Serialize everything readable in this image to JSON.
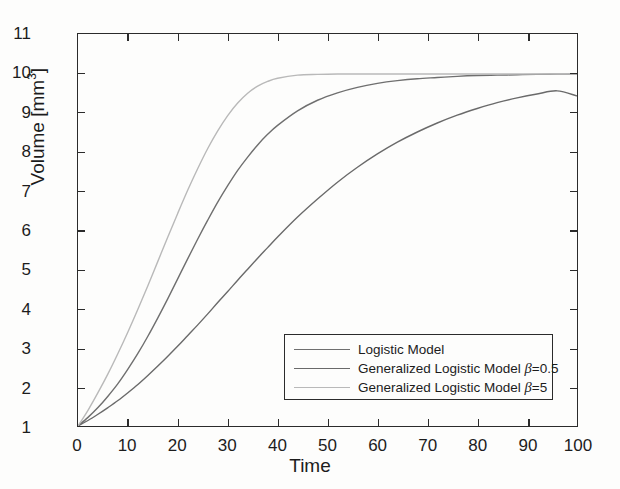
{
  "chart_data": {
    "type": "line",
    "title": "",
    "xlabel": "Time",
    "ylabel_text": "Volume [mm",
    "ylabel_sup": "3",
    "ylabel_tail": "]",
    "xlim": [
      0,
      100
    ],
    "ylim": [
      1,
      11
    ],
    "xticks": [
      0,
      10,
      20,
      30,
      40,
      50,
      60,
      70,
      80,
      90,
      100
    ],
    "yticks": [
      1,
      2,
      3,
      4,
      5,
      6,
      7,
      8,
      9,
      10,
      11
    ],
    "grid": false,
    "legend_position": "lower right",
    "x": [
      0,
      2,
      4,
      6,
      8,
      10,
      12,
      14,
      16,
      18,
      20,
      22,
      24,
      26,
      28,
      30,
      32,
      34,
      36,
      38,
      40,
      44,
      48,
      52,
      56,
      60,
      64,
      68,
      72,
      76,
      80,
      84,
      88,
      92,
      96,
      100
    ],
    "series": [
      {
        "name": "Logistic Model",
        "color": "#6f6f6f",
        "values": [
          1.0,
          1.22,
          1.47,
          1.76,
          2.08,
          2.45,
          2.85,
          3.29,
          3.76,
          4.25,
          4.76,
          5.27,
          5.77,
          6.25,
          6.71,
          7.13,
          7.52,
          7.86,
          8.17,
          8.44,
          8.67,
          9.04,
          9.31,
          9.5,
          9.64,
          9.74,
          9.81,
          9.86,
          9.89,
          9.92,
          9.94,
          9.95,
          9.96,
          9.97,
          9.975,
          9.98
        ]
      },
      {
        "name": "Generalized Logistic Model β=0.5",
        "color": "#6a6a6a",
        "values": [
          1.0,
          1.14,
          1.3,
          1.47,
          1.65,
          1.85,
          2.06,
          2.29,
          2.53,
          2.78,
          3.04,
          3.31,
          3.58,
          3.86,
          4.15,
          4.43,
          4.72,
          5.0,
          5.28,
          5.55,
          5.82,
          6.33,
          6.79,
          7.22,
          7.6,
          7.94,
          8.24,
          8.5,
          8.73,
          8.93,
          9.1,
          9.25,
          9.37,
          9.47,
          9.55,
          9.42
        ]
      },
      {
        "name": "Generalized Logistic Model β=5",
        "color": "#b9b9b9",
        "values": [
          1.0,
          1.4,
          1.85,
          2.33,
          2.85,
          3.4,
          3.98,
          4.58,
          5.2,
          5.82,
          6.43,
          7.02,
          7.57,
          8.08,
          8.53,
          8.92,
          9.24,
          9.49,
          9.67,
          9.79,
          9.87,
          9.95,
          9.97,
          9.98,
          9.98,
          9.98,
          9.98,
          9.98,
          9.98,
          9.98,
          9.98,
          9.98,
          9.98,
          9.98,
          9.98,
          9.98
        ]
      }
    ]
  },
  "legend": {
    "items": [
      {
        "label": "Logistic Model",
        "beta": "",
        "color": "#6f6f6f"
      },
      {
        "label": "Generalized Logistic Model ",
        "beta": "=0.5",
        "color": "#6a6a6a"
      },
      {
        "label": "Generalized Logistic Model ",
        "beta": "=5",
        "color": "#b9b9b9"
      }
    ]
  },
  "axes": {
    "frame_color": "#2b2b2b"
  }
}
